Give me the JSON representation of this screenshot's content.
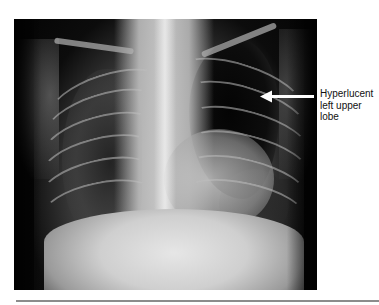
{
  "figure": {
    "image_description": "Frontal chest radiograph of a child",
    "annotation": {
      "lines": [
        "Hyperlucent",
        "left upper",
        "lobe"
      ],
      "arrow_direction": "left",
      "arrow_color": "#ffffff"
    },
    "colors": {
      "background": "#ffffff",
      "image_border": "#050505",
      "rule": "#8c8c8c",
      "label_text": "#111111"
    }
  }
}
